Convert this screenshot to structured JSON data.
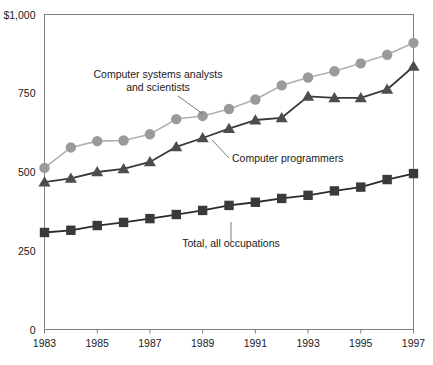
{
  "chart_data": {
    "type": "line",
    "title": "",
    "xlabel": "",
    "ylabel": "",
    "x": [
      1983,
      1984,
      1985,
      1986,
      1987,
      1988,
      1989,
      1990,
      1991,
      1992,
      1993,
      1994,
      1995,
      1996,
      1997
    ],
    "xlim": [
      1983,
      1997
    ],
    "ylim": [
      0,
      1000
    ],
    "yticks": [
      0,
      250,
      500,
      750,
      1000
    ],
    "ytick_labels": [
      "0",
      "250",
      "500",
      "750",
      "$1,000"
    ],
    "xticks": [
      1983,
      1985,
      1987,
      1989,
      1991,
      1993,
      1995,
      1997
    ],
    "xtick_labels": [
      "1983",
      "1985",
      "1987",
      "1989",
      "1991",
      "1993",
      "1995",
      "1997"
    ],
    "grid": false,
    "legend_position": "inline-annotations",
    "series": [
      {
        "name": "Computer systems analysts and scientists",
        "marker": "circle",
        "color": "#9a9a9a",
        "line_color": "#b0b0b0",
        "values": [
          513,
          578,
          598,
          600,
          620,
          668,
          678,
          700,
          730,
          775,
          800,
          820,
          845,
          872,
          910
        ]
      },
      {
        "name": "Computer programmers",
        "marker": "triangle",
        "color": "#4d4d4d",
        "line_color": "#3a3a3a",
        "values": [
          468,
          480,
          500,
          510,
          532,
          580,
          608,
          638,
          665,
          672,
          740,
          735,
          735,
          762,
          835
        ]
      },
      {
        "name": "Total, all occupations",
        "marker": "square",
        "color": "#3a3a3a",
        "line_color": "#2b2b2b",
        "values": [
          308,
          315,
          330,
          340,
          352,
          365,
          378,
          394,
          404,
          416,
          426,
          440,
          452,
          476,
          495
        ]
      }
    ],
    "annotations": [
      {
        "id": "analysts",
        "lines": [
          "Computer systems analysts",
          "and scientists"
        ],
        "text_x": 158,
        "text_y": 78,
        "anchor": "middle",
        "leader": {
          "x1": 178,
          "y1": 96,
          "x2": 203,
          "y2": 114
        }
      },
      {
        "id": "programmers",
        "lines": [
          "Computer programmers"
        ],
        "text_x": 232,
        "text_y": 162,
        "anchor": "start",
        "leader": {
          "x1": 229,
          "y1": 158,
          "x2": 212,
          "y2": 140
        }
      },
      {
        "id": "total",
        "lines": [
          "Total, all occupations"
        ],
        "text_x": 231,
        "text_y": 247,
        "anchor": "middle",
        "leader": {
          "x1": 231,
          "y1": 241,
          "x2": 231,
          "y2": 222
        }
      }
    ]
  },
  "ghost_header": {
    "text": ""
  }
}
